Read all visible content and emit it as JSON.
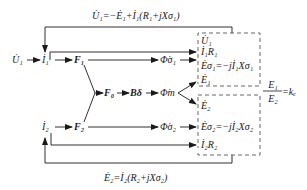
{
  "diagram": {
    "type": "transformer-phasor-flow",
    "colors": {
      "line": "#1a1a1a",
      "dashed_box": "#555555",
      "background": "#ffffff"
    },
    "equations": {
      "top": "U̇₁=−Ė₁+İ₁(R₁+jXσ₁)",
      "bottom": "Ė₂=İ₂(R₂+jXσ₂)",
      "ratio": "E₁/E₂=kₑ",
      "ratio_num": "E₁",
      "ratio_den": "E₂",
      "ratio_rhs": "=kₑ"
    },
    "nodes": {
      "u1_input": "U̇₁",
      "i1": "İ₁",
      "f1": "F₁",
      "f0": "F₀",
      "b_delta": "Bδ",
      "f2": "F₂",
      "i2": "İ₂",
      "phi_s1": "Φ̇σ₁",
      "phi_m": "Φ̇m",
      "phi_s2": "Φ̇σ₂"
    },
    "upper_box": {
      "lines": [
        "U̇₁",
        "İ₁R₁",
        "Ėσ₁=−jİ₁Xσ₁",
        "Ė₁"
      ]
    },
    "lower_box": {
      "lines": [
        "Ė₂",
        "Ėσ₂=−jİ₂Xσ₂",
        "İ₂R₂"
      ]
    }
  }
}
